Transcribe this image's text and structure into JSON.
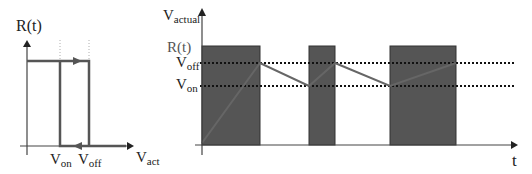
{
  "left_diagram": {
    "y_label": "R(t)",
    "x_label_main": "V",
    "x_label_sub": "act",
    "tick1_main": "V",
    "tick1_sub": "on",
    "tick2_main": "V",
    "tick2_sub": "off"
  },
  "right_diagram": {
    "y_label_main": "V",
    "y_label_sub": "actual",
    "r_label": "R(t)",
    "voff_main": "V",
    "voff_sub": "off",
    "von_main": "V",
    "von_sub": "on",
    "x_label": "t"
  },
  "colors": {
    "line": "#555555",
    "pulse_fill": "#555555",
    "axis": "#444444",
    "dotted": "#222222"
  }
}
